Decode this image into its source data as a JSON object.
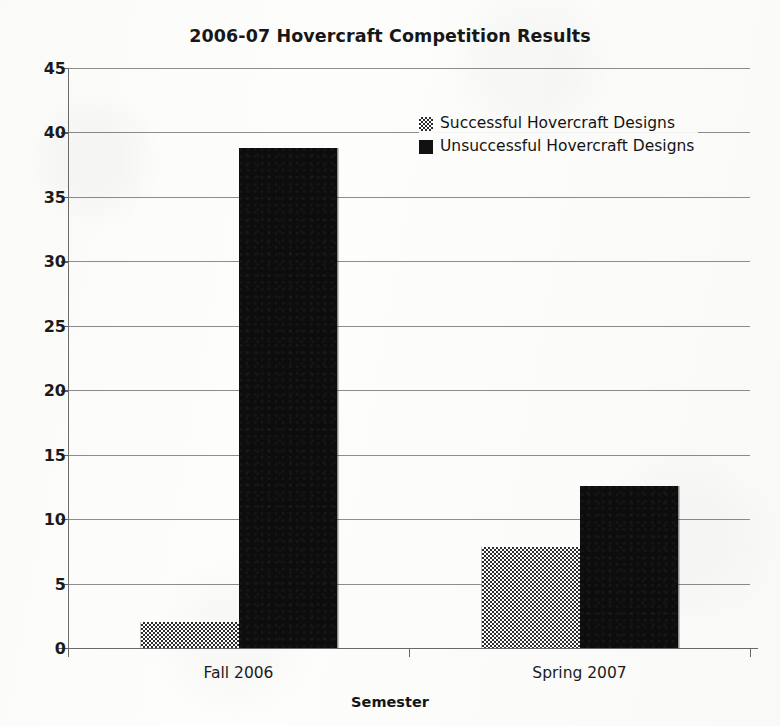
{
  "chart_data": {
    "type": "bar",
    "title": "2006-07 Hovercraft Competition Results",
    "xlabel": "Semester",
    "ylabel": "",
    "categories": [
      "Fall 2006",
      "Spring 2007"
    ],
    "series": [
      {
        "name": "Successful Hovercraft Designs",
        "swatch": "checkered-gray",
        "color": "#808080",
        "values": [
          2,
          7.8
        ]
      },
      {
        "name": "Unsuccessful Hovercraft Designs",
        "swatch": "solid-black",
        "color": "#0d0d0d",
        "values": [
          38.8,
          12.6
        ]
      }
    ],
    "ylim": [
      0,
      45
    ],
    "ytick_step": 5,
    "yticks": [
      0,
      5,
      10,
      15,
      20,
      25,
      30,
      35,
      40,
      45
    ],
    "ytick_labels": [
      "0",
      "5",
      "10",
      "15",
      "20",
      "25",
      "30",
      "35",
      "40",
      "45"
    ],
    "grid": "horizontal",
    "legend_position": "upper-center-right"
  },
  "legend": {
    "entries": [
      {
        "label": "Successful Hovercraft Designs"
      },
      {
        "label": "Unsuccessful Hovercraft Designs"
      }
    ]
  }
}
